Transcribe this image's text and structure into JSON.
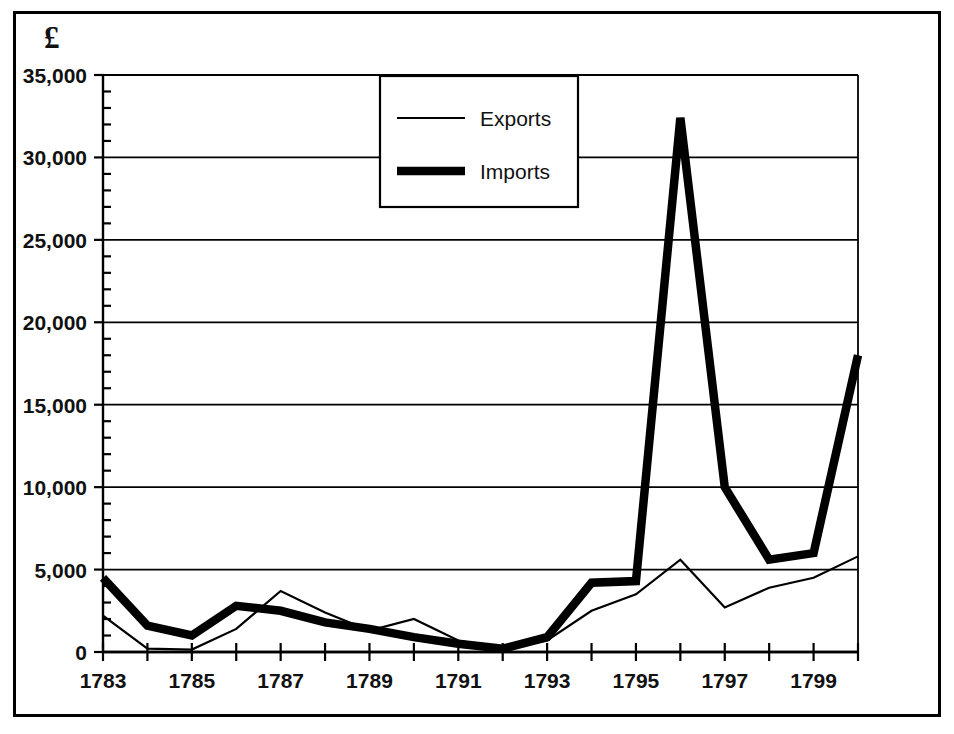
{
  "chart_data": {
    "type": "line",
    "title": "",
    "subtitle": "",
    "xlabel": "",
    "ylabel": "£",
    "y_axis_unit_symbol": "£",
    "x": [
      1783,
      1784,
      1785,
      1786,
      1787,
      1788,
      1789,
      1790,
      1791,
      1792,
      1793,
      1794,
      1795,
      1796,
      1797,
      1798,
      1799,
      1800
    ],
    "x_tick_labels": [
      "1783",
      "",
      "1785",
      "",
      "1787",
      "",
      "1789",
      "",
      "1791",
      "",
      "1793",
      "",
      "1795",
      "",
      "1797",
      "",
      "1799",
      ""
    ],
    "x_labels_shown": [
      "1783",
      "1785",
      "1787",
      "1789",
      "1791",
      "1793",
      "1795",
      "1797",
      "1799"
    ],
    "y_tick_labels": [
      "0",
      "5,000",
      "10,000",
      "15,000",
      "20,000",
      "25,000",
      "30,000",
      "35,000"
    ],
    "y_ticks": [
      0,
      5000,
      10000,
      15000,
      20000,
      25000,
      30000,
      35000
    ],
    "y_minor_tick_step": 1000,
    "xlim": [
      1783,
      1800
    ],
    "ylim": [
      0,
      35000
    ],
    "grid": true,
    "grid_axis": "y",
    "legend_position": "top-center",
    "series": [
      {
        "name": "Exports",
        "line_style": "thin",
        "color": "#000000",
        "line_width": 2,
        "values": [
          2200,
          200,
          150,
          1400,
          3700,
          2400,
          1300,
          2000,
          700,
          200,
          700,
          2500,
          3500,
          5600,
          2700,
          3900,
          4500,
          5800
        ]
      },
      {
        "name": "Imports",
        "line_style": "thick",
        "color": "#000000",
        "line_width": 9,
        "values": [
          4500,
          1600,
          1000,
          2800,
          2500,
          1800,
          1400,
          900,
          500,
          200,
          900,
          4200,
          4300,
          32400,
          10000,
          5600,
          6000,
          18000
        ]
      }
    ]
  },
  "legend": {
    "entries": [
      {
        "label": "Exports",
        "style": "thin"
      },
      {
        "label": "Imports",
        "style": "thick"
      }
    ]
  },
  "axes": {
    "y_unit": "£"
  }
}
